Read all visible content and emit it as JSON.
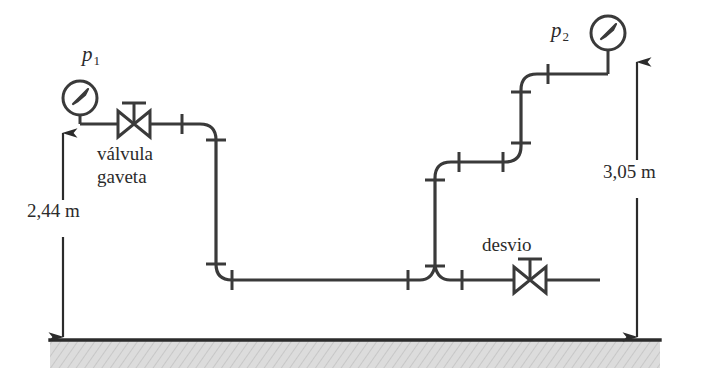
{
  "figure": {
    "type": "piping-schematic",
    "background_color": "#ffffff",
    "line_color": "#3a3a3a",
    "text_color": "#2b2b2b",
    "ground_fill": "#d9d9d9"
  },
  "labels": {
    "p1": "p",
    "p1_sub": "1",
    "p2": "p",
    "p2_sub": "2",
    "valve_line1": "válvula",
    "valve_line2": "gaveta",
    "bypass": "desvio",
    "height_left": "2,44 m",
    "height_right": "3,05 m"
  },
  "components": [
    {
      "name": "pressure-gauge-p1",
      "kind": "gauge",
      "cx": 80,
      "cy": 98,
      "r": 17
    },
    {
      "name": "pressure-gauge-p2",
      "kind": "gauge",
      "cx": 608,
      "cy": 33,
      "r": 17
    },
    {
      "name": "gate-valve",
      "kind": "gate-valve",
      "cx": 134,
      "cy": 124
    },
    {
      "name": "bypass-valve",
      "kind": "gate-valve",
      "cx": 530,
      "cy": 292
    },
    {
      "name": "tee-junction",
      "kind": "tee",
      "cx": 435,
      "cy": 292
    }
  ],
  "dimensions": [
    {
      "name": "elevation-left",
      "value": "2,44 m",
      "x": 63,
      "from_y": 133,
      "to_y": 337
    },
    {
      "name": "elevation-right",
      "value": "3,05 m",
      "x": 637,
      "from_y": 62,
      "to_y": 337
    }
  ],
  "ground": {
    "x_start": 50,
    "x_end": 660,
    "y": 340,
    "thickness": 28
  }
}
